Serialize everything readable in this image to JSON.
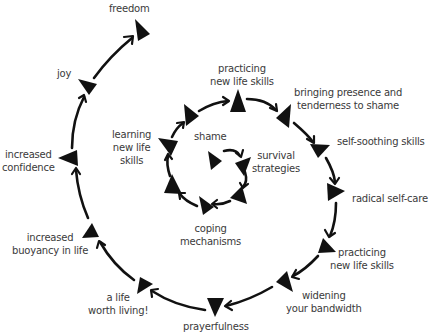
{
  "diagram": {
    "type": "spiral",
    "stages": [
      {
        "id": "shame",
        "lines": [
          "shame"
        ]
      },
      {
        "id": "survival",
        "lines": [
          "survival",
          "strategies"
        ]
      },
      {
        "id": "coping",
        "lines": [
          "coping",
          "mechanisms"
        ]
      },
      {
        "id": "learning",
        "lines": [
          "learning",
          "new life",
          "skills"
        ]
      },
      {
        "id": "practicing1",
        "lines": [
          "practicing",
          "new life skills"
        ]
      },
      {
        "id": "bringing",
        "lines": [
          "bringing presence and",
          "tenderness to shame"
        ]
      },
      {
        "id": "selfsoothing",
        "lines": [
          "self-soothing skills"
        ]
      },
      {
        "id": "radical",
        "lines": [
          "radical self-care"
        ]
      },
      {
        "id": "practicing2",
        "lines": [
          "practicing",
          "new life skills"
        ]
      },
      {
        "id": "widening",
        "lines": [
          "widening",
          "your bandwidth"
        ]
      },
      {
        "id": "prayerfulness",
        "lines": [
          "prayerfulness"
        ]
      },
      {
        "id": "alife",
        "lines": [
          "a life",
          "worth living!"
        ]
      },
      {
        "id": "buoyancy",
        "lines": [
          "increased",
          "buoyancy in life"
        ]
      },
      {
        "id": "confidence",
        "lines": [
          "increased",
          "confidence"
        ]
      },
      {
        "id": "joy",
        "lines": [
          "joy"
        ]
      },
      {
        "id": "freedom",
        "lines": [
          "freedom"
        ]
      }
    ],
    "colors": {
      "ink": "#111111",
      "text": "#3a3a3a",
      "background": "#ffffff"
    }
  }
}
